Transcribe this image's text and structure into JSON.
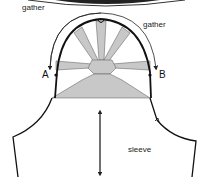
{
  "diagram": {
    "type": "sewing-pattern",
    "labels": {
      "gather_top_left": "gather",
      "gather_right": "gather",
      "point_a": "A",
      "point_b": "B",
      "sleeve": "sleeve"
    },
    "colors": {
      "outline": "#111111",
      "shading": "#c8c8c8",
      "arrow": "#222222",
      "background": "#ffffff"
    }
  }
}
